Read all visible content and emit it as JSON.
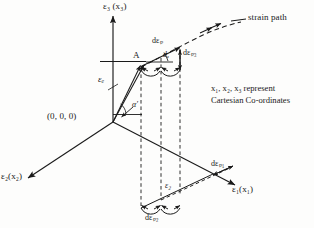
{
  "figure": {
    "background_color": "#fdfdfc",
    "ink_color": "#1a1a1a",
    "axes": {
      "vertical_label": "ε₃ (x₃)",
      "right_label": "ε₁(x₁)",
      "left_label": "ε₂(x₂)"
    },
    "origin_label": "(0, 0, 0)",
    "point_label": "A",
    "elastic_strain_label": "εₑ",
    "plastic_increment_label": "dεₚ",
    "plastic_component_3": "dεₚ₃",
    "plastic_component_1": "dεₚ₁",
    "plastic_component_2": "dεₚ₂",
    "projection_label": "ε₂",
    "angle_alpha": "α′",
    "angle_d_alpha": "dₐ′",
    "strain_path_label": "strain path",
    "note_line1": "x₁, x₂, x₃ represent",
    "note_line2": "Cartesian Co-ordinates"
  }
}
